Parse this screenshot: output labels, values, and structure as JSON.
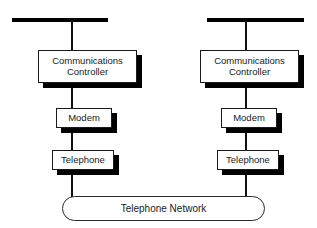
{
  "diagram": {
    "background_color": "#ffffff",
    "line_color": "#000000",
    "text_color": "#1a1a1a",
    "shadow_color": "#000000",
    "branches": [
      {
        "id": "left",
        "bus_label": "",
        "nodes": [
          {
            "id": "left-communications-controller",
            "label": "Communications\nController"
          },
          {
            "id": "left-modem",
            "label": "Modem"
          },
          {
            "id": "left-telephone",
            "label": "Telephone"
          }
        ]
      },
      {
        "id": "right",
        "bus_label": "",
        "nodes": [
          {
            "id": "right-communications-controller",
            "label": "Communications\nController"
          },
          {
            "id": "right-modem",
            "label": "Modem"
          },
          {
            "id": "right-telephone",
            "label": "Telephone"
          }
        ]
      }
    ],
    "network": {
      "label": "Telephone Network",
      "shape": "rounded-rectangle"
    }
  }
}
